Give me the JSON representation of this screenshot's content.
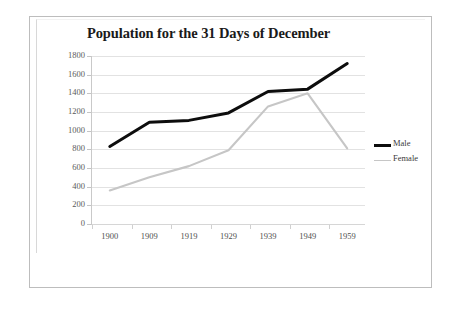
{
  "chart_data": {
    "type": "line",
    "title": "Population for the 31 Days of December",
    "xlabel": "",
    "ylabel": "",
    "categories": [
      "1900",
      "1909",
      "1919",
      "1929",
      "1939",
      "1949",
      "1959"
    ],
    "series": [
      {
        "name": "Male",
        "color": "#0d0d0d",
        "values": [
          830,
          1090,
          1110,
          1190,
          1420,
          1445,
          1720
        ]
      },
      {
        "name": "Female",
        "color": "#c6c6c6",
        "values": [
          360,
          500,
          620,
          790,
          1260,
          1400,
          810
        ]
      }
    ],
    "ylim": [
      0,
      1800
    ],
    "y_ticks": [
      "1800",
      "1600",
      "1400",
      "1200",
      "1000",
      "800",
      "600",
      "400",
      "200",
      "0"
    ],
    "y_tick_values": [
      1800,
      1600,
      1400,
      1200,
      1000,
      800,
      600,
      400,
      200,
      0
    ],
    "grid": true,
    "legend_position": "right"
  },
  "legend": {
    "items": [
      {
        "label": "Male",
        "swatch": "thick-black-line"
      },
      {
        "label": "Female",
        "swatch": "thin-gray-line"
      }
    ]
  },
  "colors": {
    "male_line": "#0d0d0d",
    "female_line": "#c6c6c6",
    "gridline": "#e2e2e2",
    "frame_border": "#bdbdbd",
    "title_text": "#1a1a1a",
    "tick_text": "#5a5a5a",
    "background": "#ffffff"
  }
}
